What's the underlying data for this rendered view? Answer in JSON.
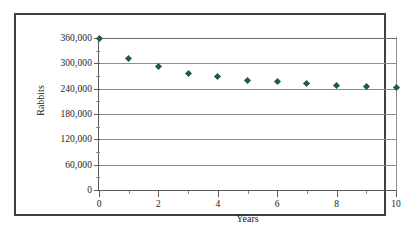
{
  "chart_data": {
    "type": "scatter",
    "title": "",
    "xlabel": "Years",
    "ylabel": "Rabbits",
    "xlim": [
      0,
      10
    ],
    "ylim": [
      0,
      360000
    ],
    "grid": true,
    "legend": "none",
    "marker_color": "#1f5c4a",
    "marker_shape": "diamond",
    "x": [
      0,
      1,
      2,
      3,
      4,
      5,
      6,
      7,
      8,
      9,
      10
    ],
    "values": [
      360000,
      312000,
      292000,
      277000,
      268000,
      260000,
      256000,
      252000,
      248000,
      245000,
      243000
    ],
    "series": [
      {
        "name": "Rabbits",
        "values": [
          360000,
          312000,
          292000,
          277000,
          268000,
          260000,
          256000,
          252000,
          248000,
          245000,
          243000
        ]
      }
    ],
    "ytick_values": [
      0,
      60000,
      120000,
      180000,
      240000,
      300000,
      360000
    ],
    "ytick_labels": [
      "0",
      "60,000",
      "120,000",
      "180,000",
      "240,000",
      "300,000",
      "360,000"
    ],
    "xtick_values": [
      0,
      1,
      2,
      3,
      4,
      5,
      6,
      7,
      8,
      9,
      10
    ],
    "xtick_labels": [
      "0",
      "",
      "2",
      "",
      "4",
      "",
      "6",
      "",
      "8",
      "",
      "10"
    ],
    "xtick_major": [
      0,
      2,
      4,
      6,
      8,
      10
    ],
    "xtick_minor": [
      1,
      3,
      5,
      7,
      9
    ]
  },
  "axes": {
    "x_title": "Years",
    "y_title": "Rabbits"
  },
  "colors": {
    "marker": "#1f5c4a",
    "gridline": "#8d8d8d",
    "axis": "#5a5a5a",
    "frame": "#3f3f3f",
    "background": "#ffffff"
  }
}
